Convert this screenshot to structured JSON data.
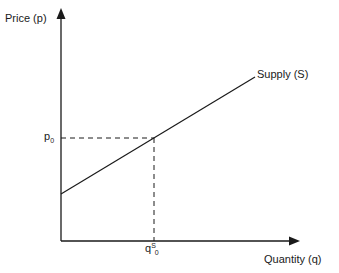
{
  "diagram": {
    "type": "supply-curve",
    "y_axis": {
      "label": "Price (p)"
    },
    "x_axis": {
      "label": "Quantity (q)"
    },
    "curve": {
      "label": "Supply (S)"
    },
    "price_marker": {
      "base": "p",
      "subscript": "0"
    },
    "quantity_marker": {
      "base": "q",
      "superscript": "S",
      "subscript": "0"
    },
    "colors": {
      "line": "#1a1a1a",
      "background": "#ffffff"
    }
  }
}
